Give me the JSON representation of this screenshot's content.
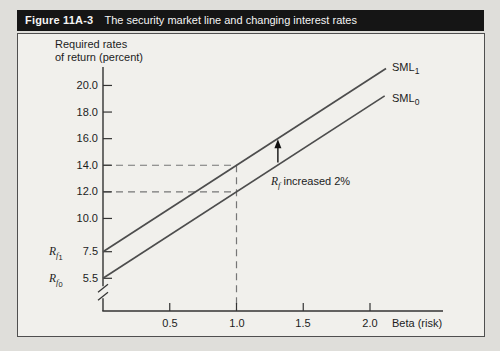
{
  "figure": {
    "tag": "Figure 11A-3",
    "caption": "The security market line and changing interest rates"
  },
  "colors": {
    "page_bg": "#dfdeda",
    "panel_bg": "#f1f0ec",
    "header_bg": "#151515",
    "header_text": "#f4f4f4",
    "axis": "#333333",
    "line": "#4d4d4d",
    "dashed": "#767676",
    "arrow": "#111111",
    "text": "#1c1c1c"
  },
  "chart_data": {
    "type": "line",
    "title": "The security market line and changing interest rates",
    "ylabel_line1": "Required rates",
    "ylabel_line2": "of return (percent)",
    "xlabel": "Beta (risk)",
    "y_ticks": [
      "20.0",
      "18.0",
      "16.0",
      "14.0",
      "12.0",
      "10.0",
      "7.5",
      "5.5"
    ],
    "y_tick_values": [
      20.0,
      18.0,
      16.0,
      14.0,
      12.0,
      10.0,
      7.5,
      5.5
    ],
    "x_ticks": [
      "0.5",
      "1.0",
      "1.5",
      "2.0"
    ],
    "x_tick_values": [
      0.5,
      1.0,
      1.5,
      2.0
    ],
    "x_range": [
      0,
      2.25
    ],
    "y_axis_break_below": 5.5,
    "series": [
      {
        "name": "SML0",
        "label": {
          "text": "SML",
          "sub": "0"
        },
        "intercept": 5.5,
        "slope": 6.5,
        "x_start": 0,
        "x_end": 2.11
      },
      {
        "name": "SML1",
        "label": {
          "text": "SML",
          "sub": "1"
        },
        "intercept": 7.5,
        "slope": 6.5,
        "x_start": 0,
        "x_end": 2.12
      }
    ],
    "risk_free_rates": [
      {
        "base": "R",
        "sub": "f",
        "subsub": "1",
        "value": "7.5"
      },
      {
        "base": "R",
        "sub": "f",
        "subsub": "0",
        "value": "5.5"
      }
    ],
    "guide_lines": {
      "beta": 1.0,
      "sml0_y": 12.0,
      "sml1_y": 14.0
    },
    "arrow": {
      "x": 1.31,
      "y_from": 14.2,
      "y_to": 15.95
    },
    "annotation": {
      "base": "R",
      "sub": "f",
      "rest": " increased 2%"
    }
  }
}
